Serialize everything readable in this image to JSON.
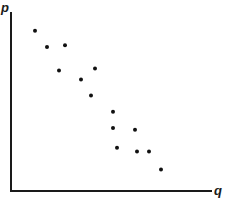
{
  "chart_data": {
    "type": "scatter",
    "title": "",
    "xlabel": "q",
    "ylabel": "p",
    "grid": false,
    "legend": null,
    "xlim": [
      0,
      100
    ],
    "ylim": [
      0,
      100
    ],
    "points": [
      {
        "x": 12,
        "y": 89
      },
      {
        "x": 18,
        "y": 80
      },
      {
        "x": 27,
        "y": 81
      },
      {
        "x": 24,
        "y": 67
      },
      {
        "x": 42,
        "y": 68
      },
      {
        "x": 35,
        "y": 62
      },
      {
        "x": 40,
        "y": 53
      },
      {
        "x": 51,
        "y": 44
      },
      {
        "x": 51,
        "y": 35
      },
      {
        "x": 62,
        "y": 34
      },
      {
        "x": 53,
        "y": 24
      },
      {
        "x": 63,
        "y": 22
      },
      {
        "x": 69,
        "y": 22
      },
      {
        "x": 75,
        "y": 12
      }
    ]
  },
  "colors": {
    "axis": "#1a1a1a",
    "point": "#111111"
  }
}
